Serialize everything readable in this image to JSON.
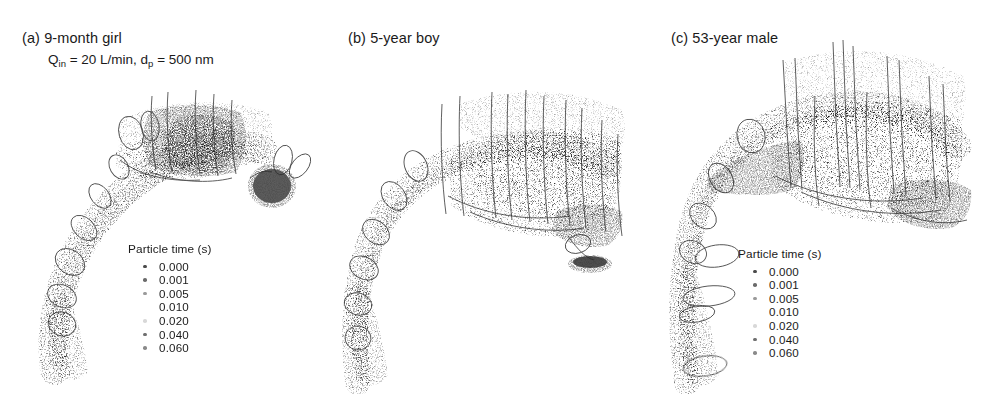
{
  "figure": {
    "background": "#ffffff",
    "panels": [
      {
        "id": "a",
        "title": "(a) 9-month girl",
        "subtitle_pre": "Q",
        "subtitle_sub1": "in",
        "subtitle_mid": " = 20 L/min, d",
        "subtitle_sub2": "p",
        "subtitle_post": " = 500 nm",
        "legend": {
          "title": "Particle time (s)",
          "entries": [
            {
              "label": "0.000",
              "color": "#4a4a4a"
            },
            {
              "label": "0.001",
              "color": "#6b6b6b"
            },
            {
              "label": "0.005",
              "color": "#9a9a9a"
            },
            {
              "label": "0.010",
              "color": "#ffffff"
            },
            {
              "label": "0.020",
              "color": "#d8d8d8"
            },
            {
              "label": "0.040",
              "color": "#6f6f6f"
            },
            {
              "label": "0.060",
              "color": "#8a8a8a"
            }
          ]
        }
      },
      {
        "id": "b",
        "title": "(b) 5-year boy",
        "legend": {
          "title": "Particle time (s)",
          "entries": [
            {
              "label": "0.000",
              "color": "#4a4a4a"
            },
            {
              "label": "0.001",
              "color": "#6b6b6b"
            },
            {
              "label": "0.005",
              "color": "#9a9a9a"
            },
            {
              "label": "0.010",
              "color": "#ffffff"
            },
            {
              "label": "0.020",
              "color": "#d8d8d8"
            },
            {
              "label": "0.040",
              "color": "#6f6f6f"
            },
            {
              "label": "0.060",
              "color": "#8a8a8a"
            }
          ]
        }
      },
      {
        "id": "c",
        "title": "(c) 53-year male",
        "legend": {
          "title": "Particle time (s)",
          "entries": [
            {
              "label": "0.000",
              "color": "#4a4a4a"
            },
            {
              "label": "0.001",
              "color": "#6b6b6b"
            },
            {
              "label": "0.005",
              "color": "#9a9a9a"
            },
            {
              "label": "0.010",
              "color": "#ffffff"
            },
            {
              "label": "0.020",
              "color": "#d8d8d8"
            },
            {
              "label": "0.040",
              "color": "#6f6f6f"
            },
            {
              "label": "0.060",
              "color": "#8a8a8a"
            },
            {
              "label": "0.080",
              "color": "#ffffff"
            },
            {
              "label": "0.100",
              "color": "#ffffff"
            }
          ]
        }
      }
    ]
  },
  "chart_data": {
    "type": "scatter",
    "colorbar_label": "Particle time (s)",
    "colormap": "greyscale-dark-to-light",
    "series": [
      {
        "name": "(a) 9-month girl",
        "time_levels": [
          0.0,
          0.001,
          0.005,
          0.01,
          0.02,
          0.04,
          0.06
        ],
        "time_max": 0.06
      },
      {
        "name": "(b) 5-year boy",
        "time_levels": [
          0.0,
          0.001,
          0.005,
          0.01,
          0.02,
          0.04,
          0.06
        ],
        "time_max": 0.06
      },
      {
        "name": "(c) 53-year male",
        "time_levels": [
          0.0,
          0.001,
          0.005,
          0.01,
          0.02,
          0.04,
          0.06,
          0.08,
          0.1
        ],
        "time_max": 0.1
      }
    ],
    "conditions": {
      "inlet_flow_rate": "20 L/min",
      "particle_diameter": "500 nm"
    },
    "xlabel": "",
    "ylabel": "",
    "grid": false,
    "legend_position": "inside-each-panel"
  }
}
